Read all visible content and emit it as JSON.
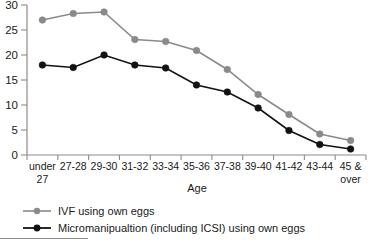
{
  "chart_data": {
    "type": "line",
    "title": "",
    "xlabel": "Age",
    "ylabel": "",
    "categories": [
      "under 27",
      "27-28",
      "29-30",
      "31-32",
      "33-34",
      "35-36",
      "37-38",
      "39-40",
      "41-42",
      "43-44",
      "45 & over"
    ],
    "category_lines": [
      [
        "under",
        "27"
      ],
      [
        "27-28",
        ""
      ],
      [
        "29-30",
        ""
      ],
      [
        "31-32",
        ""
      ],
      [
        "33-34",
        ""
      ],
      [
        "35-36",
        ""
      ],
      [
        "37-38",
        ""
      ],
      [
        "39-40",
        ""
      ],
      [
        "41-42",
        ""
      ],
      [
        "43-44",
        ""
      ],
      [
        "45 &",
        "over"
      ]
    ],
    "yticks": [
      0,
      5,
      10,
      15,
      20,
      25,
      30
    ],
    "ylim": [
      0,
      30
    ],
    "grid": false,
    "legend_position": "bottom-left",
    "series": [
      {
        "name": "IVF using own eggs",
        "color": "#8a8a8a",
        "marker": "circle",
        "values": [
          27.0,
          28.3,
          28.6,
          23.1,
          22.7,
          20.9,
          17.1,
          12.1,
          8.1,
          4.2,
          2.9
        ]
      },
      {
        "name": "Micromanipualtion (including ICSI) using own eggs",
        "color": "#121212",
        "marker": "circle",
        "values": [
          18.0,
          17.5,
          20.0,
          18.0,
          17.4,
          14.0,
          12.6,
          9.4,
          4.9,
          2.1,
          1.2
        ]
      }
    ]
  },
  "legend": {
    "items": [
      {
        "label": "IVF using own eggs",
        "color": "#8a8a8a"
      },
      {
        "label": "Micromanipualtion (including ICSI) using own eggs",
        "color": "#121212"
      }
    ]
  },
  "axes": {
    "x_title": "Age",
    "axis_color": "#8c8c8c"
  }
}
